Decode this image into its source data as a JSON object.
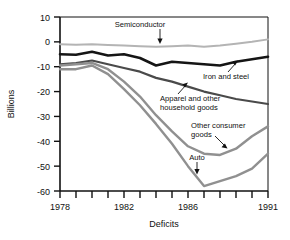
{
  "chart_data": {
    "type": "line",
    "title": "",
    "xlabel": "Deficits",
    "ylabel": "Billions",
    "xlim": [
      1978,
      1991
    ],
    "ylim": [
      -60,
      10
    ],
    "grid": false,
    "legend": "none (direct line labels with arrows)",
    "x": [
      1978,
      1979,
      1980,
      1981,
      1982,
      1983,
      1984,
      1985,
      1986,
      1987,
      1988,
      1989,
      1990,
      1991
    ],
    "xticks": [
      1978,
      1979,
      1980,
      1981,
      1982,
      1983,
      1984,
      1985,
      1986,
      1987,
      1988,
      1989,
      1990,
      1991
    ],
    "xticklabels_shown": [
      "1978",
      "1982",
      "1986",
      "1991"
    ],
    "yticks": [
      10,
      0,
      -10,
      -20,
      -30,
      -40,
      -50,
      -60
    ],
    "yticklabels": [
      "10",
      "0",
      "-10",
      "-20",
      "-30",
      "-40",
      "-50",
      "-60"
    ],
    "series": [
      {
        "name": "Semiconductor",
        "color": "#b4b4b4",
        "label_text": "Semiconductor",
        "values": [
          -1.0,
          -1.2,
          -1.0,
          -1.3,
          -1.5,
          -1.8,
          -2.0,
          -1.8,
          -1.5,
          -2.0,
          -1.5,
          -0.8,
          0.0,
          1.0
        ]
      },
      {
        "name": "Iron and steel",
        "color": "#151515",
        "label_text": "Iron and steel",
        "values": [
          -5.0,
          -5.2,
          -4.0,
          -5.5,
          -5.0,
          -6.5,
          -9.5,
          -8.0,
          -8.5,
          -9.0,
          -9.5,
          -8.0,
          -7.0,
          -6.0
        ]
      },
      {
        "name": "Apparel and other household goods",
        "color": "#4a4a4a",
        "label_text": "Apparel and other household goods",
        "values": [
          -9.0,
          -8.5,
          -7.5,
          -9.0,
          -10.5,
          -12.0,
          -14.5,
          -16.0,
          -18.0,
          -20.0,
          -21.5,
          -23.0,
          -24.0,
          -25.0
        ]
      },
      {
        "name": "Other consumer goods",
        "color": "#909090",
        "label_text": "Other consumer goods",
        "values": [
          -9.5,
          -9.0,
          -8.5,
          -11.0,
          -16.0,
          -22.0,
          -29.5,
          -36.0,
          -42.0,
          -45.0,
          -45.5,
          -43.0,
          -38.0,
          -34.0
        ]
      },
      {
        "name": "Auto",
        "color": "#909090",
        "label_text": "Auto",
        "values": [
          -11.0,
          -11.0,
          -9.5,
          -13.0,
          -19.0,
          -25.5,
          -33.0,
          -41.0,
          -50.0,
          -58.0,
          -56.0,
          -54.0,
          -51.0,
          -45.0
        ]
      }
    ],
    "annotations": [
      {
        "text": "Semiconductor",
        "points_to": "Semiconductor",
        "arrow": "down"
      },
      {
        "text": "Iron and steel",
        "points_to": "Iron and steel",
        "arrow": "up-right"
      },
      {
        "text": "Apparel and other household goods",
        "points_to": "Apparel and other household goods",
        "arrow": "up-right"
      },
      {
        "text": "Other consumer goods",
        "points_to": "Other consumer goods",
        "arrow": "down-right"
      },
      {
        "text": "Auto",
        "points_to": "Auto",
        "arrow": "down"
      }
    ]
  },
  "axes": {
    "y_title": "Billions",
    "x_title": "Deficits",
    "y_ticks": [
      "10",
      "0",
      "-10",
      "-20",
      "-30",
      "-40",
      "-50",
      "-60"
    ],
    "x_ticks": [
      "1978",
      "1982",
      "1986",
      "1991"
    ]
  },
  "labels": {
    "semiconductor": "Semiconductor",
    "iron_and_steel": "Iron and steel",
    "apparel_line1": "Apparel and other",
    "apparel_line2": "household goods",
    "other_consumer_line1": "Other consumer",
    "other_consumer_line2": "goods",
    "auto": "Auto"
  },
  "colors": {
    "semiconductor": "#b4b4b4",
    "iron_and_steel": "#151515",
    "apparel": "#4a4a4a",
    "other_consumer": "#909090",
    "auto": "#909090",
    "axis": "#111111",
    "background": "#ffffff"
  }
}
